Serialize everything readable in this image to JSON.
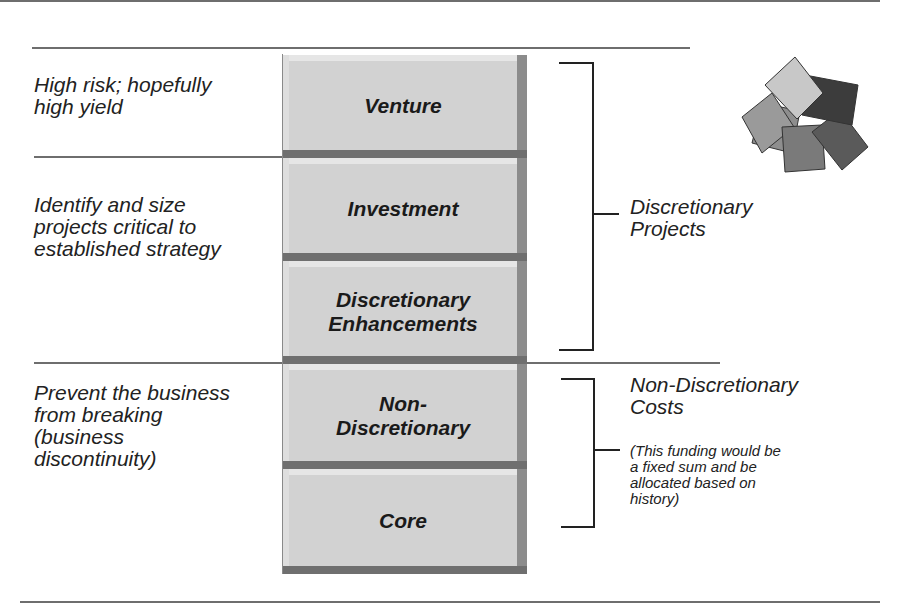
{
  "rows": [
    {
      "description": "High risk; hopefully high yield",
      "desc_lines": [
        "High risk; hopefully",
        "high yield"
      ]
    },
    {
      "description": "Identify and size projects critical to established strategy",
      "desc_lines": [
        "Identify and size",
        "projects critical to",
        "established strategy"
      ]
    },
    {
      "description": "Prevent the business from breaking (business discontinuity)",
      "desc_lines": [
        "Prevent the business",
        "from breaking",
        "(business",
        "discontinuity)"
      ]
    }
  ],
  "blocks": [
    {
      "label": "Venture",
      "lines": [
        "Venture"
      ]
    },
    {
      "label": "Investment",
      "lines": [
        "Investment"
      ]
    },
    {
      "label": "Discretionary Enhancements",
      "lines": [
        "Discretionary",
        "Enhancements"
      ]
    },
    {
      "label": "Non-Discretionary",
      "lines": [
        "Non-",
        "Discretionary"
      ]
    },
    {
      "label": "Core",
      "lines": [
        "Core"
      ]
    }
  ],
  "groups": {
    "discretionary": {
      "lines": [
        "Discretionary",
        "Projects"
      ]
    },
    "non_discretionary": {
      "lines": [
        "Non-Discretionary",
        "Costs"
      ],
      "note_lines": [
        "(This funding would be",
        "a fixed sum and be",
        "allocated based on",
        "history)"
      ]
    }
  },
  "colors": {
    "block_face": "#d2d2d2",
    "block_shadow": "#6f6f6f",
    "rule": "#6e6e6e",
    "logo": [
      "#c8c8c8",
      "#3c3c3c",
      "#8e8e8e",
      "#9a9a9a",
      "#7a7a7a",
      "#5a5a5a"
    ]
  }
}
